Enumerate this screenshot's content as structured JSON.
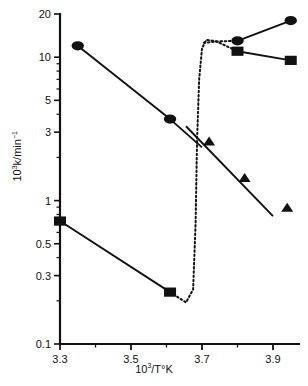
{
  "chart_data": {
    "type": "scatter",
    "title": "",
    "xlabel": "10^3/T°K",
    "ylabel": "10^3 k/min^-1",
    "xscale": "linear",
    "yscale": "log",
    "xlim": [
      3.28,
      3.99
    ],
    "ylim": [
      0.1,
      20
    ],
    "xticks": [
      "3.3",
      "3.5",
      "3.7",
      "3.9"
    ],
    "xtick_values": [
      3.3,
      3.5,
      3.7,
      3.9
    ],
    "xminor_values": [
      3.4,
      3.6,
      3.8
    ],
    "yticks": [
      "20",
      "10",
      "5",
      "3",
      "1",
      "0.5",
      "0.3",
      "0.1"
    ],
    "ytick_values": [
      20,
      10,
      5,
      3,
      1,
      0.5,
      0.3,
      0.1
    ],
    "grid": false,
    "legend": "none",
    "series": [
      {
        "name": "circles-low-temperature-branch",
        "marker": "circle",
        "line": "solid",
        "points": [
          {
            "x": 3.35,
            "y": 12.0
          },
          {
            "x": 3.61,
            "y": 3.7
          }
        ],
        "line_extends_to": {
          "x": 3.7,
          "y": 2.35
        }
      },
      {
        "name": "circles-high-rate-branch",
        "marker": "circle",
        "line": "solid",
        "points": [
          {
            "x": 3.8,
            "y": 13.0
          },
          {
            "x": 3.95,
            "y": 18.0
          }
        ]
      },
      {
        "name": "squares-high-rate-branch",
        "marker": "square",
        "line": "solid",
        "points": [
          {
            "x": 3.8,
            "y": 11.0
          },
          {
            "x": 3.95,
            "y": 9.5
          }
        ]
      },
      {
        "name": "squares-low-rate-branch",
        "marker": "square",
        "line": "solid",
        "points": [
          {
            "x": 3.3,
            "y": 0.72
          },
          {
            "x": 3.61,
            "y": 0.23
          }
        ]
      },
      {
        "name": "triangles",
        "marker": "triangle",
        "line": "none",
        "points": [
          {
            "x": 3.72,
            "y": 2.6
          },
          {
            "x": 3.82,
            "y": 1.45
          },
          {
            "x": 3.94,
            "y": 0.9
          }
        ],
        "trend_line": {
          "from": {
            "x": 3.655,
            "y": 3.3
          },
          "to": {
            "x": 3.9,
            "y": 0.78
          }
        }
      },
      {
        "name": "dotted-transition-curve",
        "marker": "none",
        "line": "dotted",
        "points": [
          {
            "x": 3.61,
            "y": 0.23
          },
          {
            "x": 3.655,
            "y": 0.195
          },
          {
            "x": 3.675,
            "y": 0.24
          },
          {
            "x": 3.682,
            "y": 0.7
          },
          {
            "x": 3.686,
            "y": 2.6
          },
          {
            "x": 3.692,
            "y": 7.0
          },
          {
            "x": 3.7,
            "y": 11.5
          },
          {
            "x": 3.712,
            "y": 13.2
          },
          {
            "x": 3.74,
            "y": 12.9
          },
          {
            "x": 3.8,
            "y": 11.0
          }
        ]
      },
      {
        "name": "dotted-upper-branch-to-circle",
        "marker": "none",
        "line": "dotted",
        "points": [
          {
            "x": 3.705,
            "y": 12.6
          },
          {
            "x": 3.75,
            "y": 12.9
          },
          {
            "x": 3.8,
            "y": 13.0
          }
        ]
      }
    ]
  },
  "axis": {
    "y_title_pre": "10",
    "y_title_sup1": "3",
    "y_title_mid": "k/min",
    "y_title_sup2": "−1",
    "x_title_pre": "10",
    "x_title_sup": "3",
    "x_title_post": "/T°K"
  },
  "colors": {
    "ink": "#111111",
    "background": "#ffffff"
  }
}
